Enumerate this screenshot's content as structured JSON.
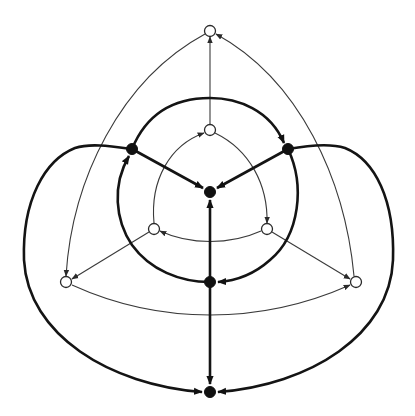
{
  "diagram": {
    "type": "directed-graph",
    "colors": {
      "background": "#ffffff",
      "thin_edge": "#3a3a3a",
      "thick_edge": "#141414",
      "black_node": "#111111",
      "white_node_fill": "#ffffff",
      "white_node_stroke": "#2a2a2a"
    },
    "nodes": [
      {
        "id": "w_outer_top",
        "kind": "white",
        "x": 210,
        "y": 31
      },
      {
        "id": "w_outer_left",
        "kind": "white",
        "x": 66,
        "y": 282
      },
      {
        "id": "w_outer_right",
        "kind": "white",
        "x": 356,
        "y": 282
      },
      {
        "id": "w_inner_top",
        "kind": "white",
        "x": 210,
        "y": 130
      },
      {
        "id": "w_inner_left",
        "kind": "white",
        "x": 154,
        "y": 229
      },
      {
        "id": "w_inner_right",
        "kind": "white",
        "x": 267,
        "y": 229
      },
      {
        "id": "b_left",
        "kind": "black",
        "x": 132,
        "y": 149
      },
      {
        "id": "b_right",
        "kind": "black",
        "x": 288,
        "y": 149
      },
      {
        "id": "b_center",
        "kind": "black",
        "x": 210,
        "y": 192
      },
      {
        "id": "b_lower",
        "kind": "black",
        "x": 210,
        "y": 282
      },
      {
        "id": "b_bottom",
        "kind": "black",
        "x": 210,
        "y": 392
      }
    ],
    "edges": [
      {
        "from": "w_inner_top",
        "to": "w_outer_top",
        "weight": "thin",
        "shape": "straight"
      },
      {
        "from": "w_outer_right",
        "to": "w_outer_top",
        "weight": "thin",
        "shape": "curve"
      },
      {
        "from": "w_outer_top",
        "to": "w_outer_left",
        "weight": "thin",
        "shape": "curve"
      },
      {
        "from": "w_inner_left",
        "to": "w_outer_left",
        "weight": "thin",
        "shape": "straight"
      },
      {
        "from": "w_inner_right",
        "to": "w_outer_right",
        "weight": "thin",
        "shape": "straight"
      },
      {
        "from": "w_outer_left",
        "to": "w_outer_right",
        "weight": "thin",
        "shape": "curve"
      },
      {
        "from": "w_inner_left",
        "to": "w_inner_top",
        "weight": "thin",
        "shape": "curve"
      },
      {
        "from": "w_inner_top",
        "to": "w_inner_right",
        "weight": "thin",
        "shape": "curve"
      },
      {
        "from": "w_inner_right",
        "to": "w_inner_left",
        "weight": "thin",
        "shape": "curve"
      },
      {
        "from": "b_left",
        "to": "b_center",
        "weight": "thick",
        "shape": "straight"
      },
      {
        "from": "b_right",
        "to": "b_center",
        "weight": "thick",
        "shape": "straight"
      },
      {
        "from": "b_lower",
        "to": "b_center",
        "weight": "thick",
        "shape": "straight"
      },
      {
        "from": "b_left",
        "to": "b_right",
        "weight": "thick",
        "shape": "arc"
      },
      {
        "from": "b_right",
        "to": "b_lower",
        "weight": "thick",
        "shape": "arc"
      },
      {
        "from": "b_lower",
        "to": "b_left",
        "weight": "thick",
        "shape": "arc"
      },
      {
        "from": "b_lower",
        "to": "b_bottom",
        "weight": "thick",
        "shape": "straight"
      },
      {
        "from": "b_left",
        "to": "b_bottom",
        "weight": "thick",
        "shape": "loop"
      },
      {
        "from": "b_right",
        "to": "b_bottom",
        "weight": "thick",
        "shape": "loop"
      }
    ]
  }
}
